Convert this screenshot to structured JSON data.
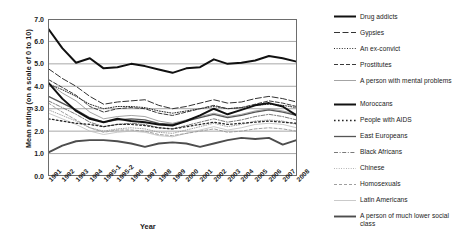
{
  "chart_data": {
    "type": "line",
    "title": "",
    "xlabel": "Year",
    "ylabel": "Mean rating (on a scale of 0 to 10)",
    "ylim": [
      0.0,
      7.0
    ],
    "yticks": [
      "0.0",
      "1.0",
      "2.0",
      "3.0",
      "4.0",
      "5.0",
      "6.0",
      "7.0"
    ],
    "grid": true,
    "legend_position": "right",
    "categories": [
      "1991",
      "1992",
      "1993",
      "1994",
      "1995-1",
      "1995-2",
      "1996",
      "1997",
      "1998",
      "1999",
      "2000",
      "2001",
      "2002",
      "2003",
      "2004",
      "2005",
      "2006",
      "2007",
      "2008"
    ],
    "series": [
      {
        "name": "Drug addicts",
        "style": "solid-thick-black",
        "color": "#111111",
        "values": [
          6.55,
          5.7,
          5.05,
          5.25,
          4.8,
          4.85,
          5.0,
          4.9,
          4.75,
          4.6,
          4.8,
          4.85,
          5.2,
          5.0,
          5.05,
          5.15,
          5.35,
          5.25,
          5.1
        ]
      },
      {
        "name": "Gypsies",
        "style": "dashed-long-black",
        "color": "#333333",
        "values": [
          4.78,
          4.35,
          4.0,
          3.55,
          3.2,
          3.3,
          3.35,
          3.4,
          3.15,
          3.0,
          3.1,
          3.25,
          3.4,
          3.25,
          3.3,
          3.45,
          3.55,
          3.45,
          3.3
        ]
      },
      {
        "name": "An ex-convict",
        "style": "dotted-black",
        "color": "#2b2b2b",
        "values": [
          4.1,
          3.85,
          3.55,
          3.2,
          3.0,
          3.1,
          3.1,
          3.05,
          2.9,
          2.8,
          2.9,
          3.0,
          3.1,
          3.0,
          3.05,
          3.15,
          3.2,
          3.15,
          3.05
        ]
      },
      {
        "name": "Prostitutes",
        "style": "dashed-medium-black",
        "color": "#3a3a3a",
        "values": [
          4.3,
          3.95,
          3.6,
          3.1,
          2.85,
          3.0,
          3.05,
          3.0,
          2.8,
          2.7,
          2.85,
          3.0,
          3.15,
          3.0,
          3.05,
          3.2,
          3.35,
          3.25,
          3.1
        ]
      },
      {
        "name": "A person with mental problems",
        "style": "solid-thin-gray",
        "color": "#9a9a9a",
        "values": [
          4.15,
          3.7,
          3.35,
          2.85,
          2.55,
          2.65,
          2.7,
          2.65,
          2.45,
          2.35,
          2.5,
          2.65,
          2.8,
          2.65,
          2.75,
          2.9,
          3.0,
          2.9,
          2.75
        ]
      },
      {
        "name": "Moroccans",
        "style": "solid-thick-black2",
        "color": "#111111",
        "values": [
          4.15,
          3.45,
          2.9,
          2.55,
          2.4,
          2.55,
          2.45,
          2.4,
          2.3,
          2.25,
          2.45,
          2.7,
          3.0,
          2.75,
          2.95,
          3.15,
          3.25,
          3.1,
          2.7
        ]
      },
      {
        "name": "People with AIDS",
        "style": "dotdash-black",
        "color": "#262626",
        "values": [
          2.55,
          2.45,
          2.35,
          2.3,
          2.2,
          2.3,
          2.3,
          2.25,
          2.15,
          2.1,
          2.2,
          2.3,
          2.4,
          2.3,
          2.35,
          2.4,
          2.45,
          2.4,
          2.35
        ]
      },
      {
        "name": "East Europeans",
        "style": "solid-medium-gray",
        "color": "#555555",
        "values": [
          3.55,
          3.25,
          2.95,
          2.6,
          2.4,
          2.5,
          2.55,
          2.5,
          2.35,
          2.3,
          2.45,
          2.6,
          2.75,
          2.6,
          2.7,
          2.85,
          2.95,
          2.85,
          2.7
        ]
      },
      {
        "name": "Black Africans",
        "style": "dashdot-gray",
        "color": "#7a7a7a",
        "values": [
          3.35,
          3.05,
          2.75,
          2.4,
          2.2,
          2.3,
          2.35,
          2.3,
          2.15,
          2.1,
          2.25,
          2.4,
          2.55,
          2.4,
          2.5,
          2.65,
          2.75,
          2.65,
          2.5
        ]
      },
      {
        "name": "Chinese",
        "style": "dotted-fine-gray",
        "color": "#8d8d8d",
        "values": [
          2.95,
          2.7,
          2.45,
          2.15,
          2.0,
          2.1,
          2.15,
          2.1,
          1.95,
          1.9,
          2.05,
          2.2,
          2.35,
          2.2,
          2.3,
          2.45,
          2.5,
          2.45,
          2.3
        ]
      },
      {
        "name": "Homosexuals",
        "style": "dashed-gray",
        "color": "#9f9f9f",
        "values": [
          3.25,
          2.85,
          2.5,
          2.15,
          1.95,
          2.05,
          2.05,
          2.0,
          1.85,
          1.8,
          1.9,
          2.0,
          2.1,
          1.95,
          2.0,
          2.1,
          2.15,
          2.1,
          2.0
        ]
      },
      {
        "name": "Latin Americans",
        "style": "solid-thin-lightgray",
        "color": "#bdbdbd",
        "values": [
          2.8,
          2.55,
          2.3,
          2.0,
          1.85,
          1.95,
          2.0,
          1.95,
          1.8,
          1.75,
          1.9,
          2.05,
          2.2,
          2.05,
          2.15,
          2.3,
          2.35,
          2.3,
          2.15
        ]
      },
      {
        "name": "A person of much lower social class",
        "style": "solid-thick-darkgray",
        "color": "#4d4d4d",
        "values": [
          1.05,
          1.35,
          1.55,
          1.6,
          1.6,
          1.55,
          1.45,
          1.3,
          1.45,
          1.5,
          1.45,
          1.3,
          1.45,
          1.6,
          1.7,
          1.65,
          1.7,
          1.4,
          1.6
        ]
      }
    ]
  },
  "legend": {
    "items": [
      {
        "label": "Drug addicts"
      },
      {
        "label": "Gypsies"
      },
      {
        "label": "An ex-convict"
      },
      {
        "label": "Prostitutes"
      },
      {
        "label": "A person with mental problems"
      },
      {
        "label": "Moroccans"
      },
      {
        "label": "People with AIDS"
      },
      {
        "label": "East Europeans"
      },
      {
        "label": "Black Africans"
      },
      {
        "label": "Chinese"
      },
      {
        "label": "Homosexuals"
      },
      {
        "label": "Latin Americans"
      },
      {
        "label": "A person of much lower social class"
      }
    ]
  }
}
